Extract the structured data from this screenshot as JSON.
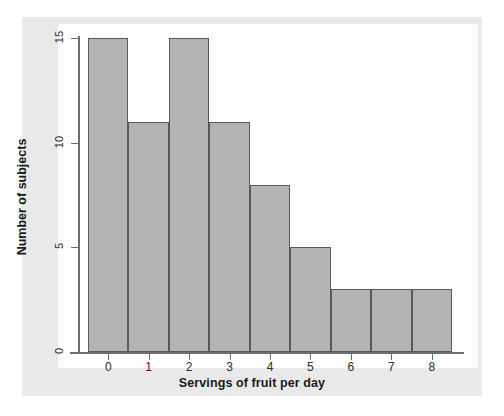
{
  "chart_data": {
    "type": "bar",
    "title": "",
    "subtitle": "",
    "xlabel": "Servings of fruit per day",
    "ylabel": "Number of subjects",
    "categories": [
      "0",
      "1",
      "2",
      "3",
      "4",
      "5",
      "6",
      "7",
      "8"
    ],
    "values": [
      15,
      11,
      15,
      11,
      8,
      5,
      3,
      3,
      3
    ],
    "series": [
      {
        "name": "Number of subjects",
        "values": [
          15,
          11,
          15,
          11,
          8,
          5,
          3,
          3,
          3
        ]
      }
    ],
    "xlim": [
      -0.5,
      8.5
    ],
    "ylim": [
      0,
      15
    ],
    "y_ticks": [
      0,
      5,
      10,
      15
    ],
    "y_tick_labels": [
      "0",
      "5",
      "10",
      "15"
    ],
    "x_ticks": [
      0,
      1,
      2,
      3,
      4,
      5,
      6,
      7,
      8
    ],
    "x_tick_labels": [
      "0",
      "1",
      "2",
      "3",
      "4",
      "5",
      "6",
      "7",
      "8"
    ],
    "grid": false,
    "legend": false,
    "legend_position": "none",
    "bar_fill_color": "#b4b4b4",
    "bar_edge_color": "#595959",
    "axis_color": "#6d6d6d",
    "plot_background": "#fdfdfd",
    "page_background": "#e9e9e9",
    "annotations": []
  }
}
